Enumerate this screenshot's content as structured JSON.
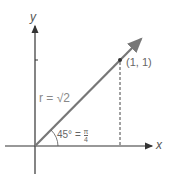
{
  "diagram": {
    "axes": {
      "x_label": "x",
      "y_label": "y"
    },
    "point": {
      "label": "(1, 1)",
      "x": 1,
      "y": 1
    },
    "radius_label": "r = √2",
    "angle_label_deg": "45° =",
    "angle_frac_num": "π",
    "angle_frac_den": "4",
    "colors": {
      "axis": "#333333",
      "vector": "#777777",
      "dashed": "#444444",
      "text": "#555555"
    }
  }
}
